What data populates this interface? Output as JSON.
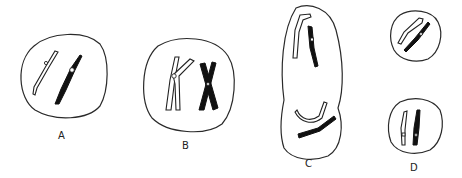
{
  "figure": {
    "panels": [
      {
        "id": "A",
        "label": "A",
        "content": "cell with one hollow and one dark unreplicated chromosome"
      },
      {
        "id": "B",
        "label": "B",
        "content": "cell with one hollow and one dark replicated chromosome (sister chromatids, X shape)"
      },
      {
        "id": "C",
        "label": "C",
        "content": "elongated dividing cell with chromosomes separating to each pole"
      },
      {
        "id": "D",
        "label": "D",
        "content": "two daughter cells each with one hollow and one dark chromosome"
      }
    ]
  },
  "colors": {
    "background": "#ffffff",
    "outline": "#2a2a2a",
    "dark_chromosome": "#111111",
    "light_chromosome": "#ffffff"
  }
}
